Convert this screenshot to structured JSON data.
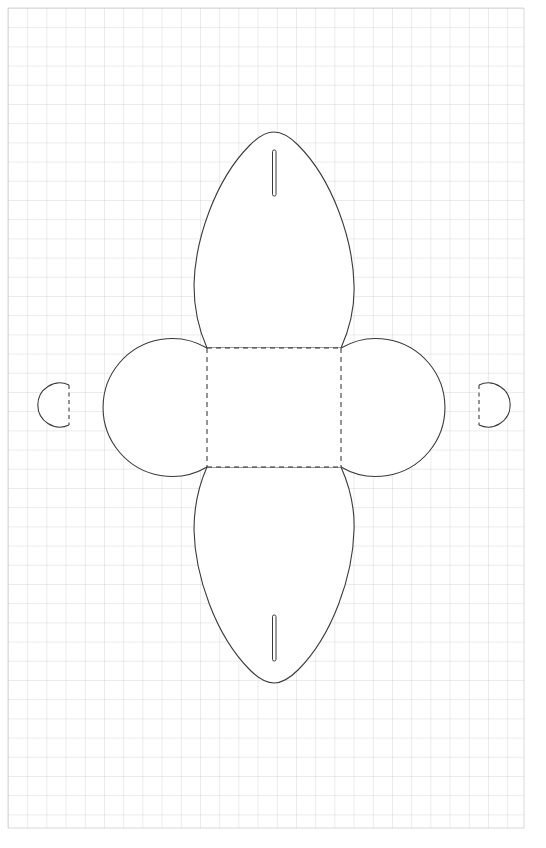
{
  "document": {
    "title": "Papercraft Fold Template",
    "subject": "box-net-with-petal-and-circle-flaps",
    "width": 546,
    "height": 848,
    "background_color": "#ffffff"
  },
  "grid": {
    "name": "graph-paper-grid",
    "line_color": "#c9c9c9",
    "minor_line_color": "#e3e3e3",
    "cell_size": 19.2,
    "origin_x": 8,
    "origin_y": 8,
    "extent_x": 524,
    "extent_y": 828,
    "columns": 27,
    "rows": 43,
    "stroke_width": 0.7
  },
  "geometry": {
    "cut_line_color": "#3a3a3a",
    "cut_line_width": 1.1,
    "fold_line_color": "#2b2b2b",
    "fold_line_width": 1.0,
    "fold_dash_pattern": "5,4",
    "fill_color": "#ffffff",
    "center_square": {
      "left": 207,
      "top": 348,
      "right": 341,
      "bottom": 467,
      "width": 134,
      "height": 119
    },
    "top_petal": {
      "tip_x": 274,
      "tip_y": 132,
      "widest_left_x": 194,
      "widest_right_x": 354,
      "widest_y": 285,
      "base_left_x": 207,
      "base_right_x": 341,
      "base_y": 348
    },
    "bottom_petal": {
      "tip_x": 274,
      "tip_y": 683,
      "widest_left_x": 194,
      "widest_right_x": 354,
      "widest_y": 530,
      "base_left_x": 207,
      "base_right_x": 341,
      "base_y": 467
    },
    "left_circle": {
      "center_x": 138,
      "center_y": 407,
      "radius": 69
    },
    "right_circle": {
      "center_x": 410,
      "center_y": 407,
      "radius": 69
    },
    "left_tab_circle": {
      "center_x": 48,
      "center_y": 404,
      "radius": 22,
      "fold_line_x": 69,
      "fold_top_y": 385,
      "fold_bottom_y": 425
    },
    "right_tab_circle": {
      "center_x": 500,
      "center_y": 404,
      "radius": 22,
      "fold_line_x": 479,
      "fold_top_y": 385,
      "fold_bottom_y": 425
    },
    "top_slit": {
      "x": 272.5,
      "top_y": 150,
      "bottom_y": 196,
      "width": 3.5
    },
    "bottom_slit": {
      "x": 272.5,
      "top_y": 615,
      "bottom_y": 661,
      "width": 3.5
    }
  }
}
